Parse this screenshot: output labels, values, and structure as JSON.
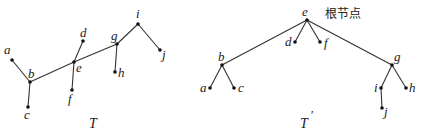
{
  "trees": [
    {
      "name": "T",
      "caption": "T",
      "nodes": [
        {
          "id": "a",
          "label": "a",
          "x": 12,
          "y": 60,
          "lx": 4,
          "ly": 54
        },
        {
          "id": "b",
          "label": "b",
          "x": 30,
          "y": 82,
          "lx": 28,
          "ly": 78
        },
        {
          "id": "c",
          "label": "c",
          "x": 28,
          "y": 107,
          "lx": 24,
          "ly": 119
        },
        {
          "id": "e",
          "label": "e",
          "x": 74,
          "y": 62,
          "lx": 76,
          "ly": 72
        },
        {
          "id": "d",
          "label": "d",
          "x": 83,
          "y": 41,
          "lx": 80,
          "ly": 37
        },
        {
          "id": "f",
          "label": "f",
          "x": 72,
          "y": 90,
          "lx": 68,
          "ly": 103
        },
        {
          "id": "g",
          "label": "g",
          "x": 117,
          "y": 44,
          "lx": 111,
          "ly": 40
        },
        {
          "id": "h",
          "label": "h",
          "x": 115,
          "y": 72,
          "lx": 118,
          "ly": 77
        },
        {
          "id": "i",
          "label": "i",
          "x": 138,
          "y": 24,
          "lx": 136,
          "ly": 18
        },
        {
          "id": "j",
          "label": "j",
          "x": 160,
          "y": 50,
          "lx": 162,
          "ly": 59
        }
      ],
      "edges": [
        [
          "a",
          "b"
        ],
        [
          "b",
          "c"
        ],
        [
          "b",
          "e"
        ],
        [
          "e",
          "d"
        ],
        [
          "e",
          "f"
        ],
        [
          "e",
          "g"
        ],
        [
          "g",
          "h"
        ],
        [
          "g",
          "i"
        ],
        [
          "i",
          "j"
        ]
      ],
      "caption_pos": {
        "x": 89,
        "y": 128
      }
    },
    {
      "name": "T'",
      "caption": "T",
      "caption_prime": "'",
      "root_annotation": "根节点",
      "nodes": [
        {
          "id": "e",
          "label": "e",
          "x": 307,
          "y": 20,
          "lx": 302,
          "ly": 16
        },
        {
          "id": "d",
          "label": "d",
          "x": 295,
          "y": 42,
          "lx": 285,
          "ly": 46
        },
        {
          "id": "f",
          "label": "f",
          "x": 320,
          "y": 42,
          "lx": 324,
          "ly": 47
        },
        {
          "id": "b",
          "label": "b",
          "x": 222,
          "y": 65,
          "lx": 218,
          "ly": 61
        },
        {
          "id": "a",
          "label": "a",
          "x": 210,
          "y": 88,
          "lx": 200,
          "ly": 92
        },
        {
          "id": "c",
          "label": "c",
          "x": 234,
          "y": 88,
          "lx": 238,
          "ly": 92
        },
        {
          "id": "g",
          "label": "g",
          "x": 392,
          "y": 65,
          "lx": 394,
          "ly": 61
        },
        {
          "id": "i",
          "label": "i",
          "x": 381,
          "y": 88,
          "lx": 374,
          "ly": 92
        },
        {
          "id": "h",
          "label": "h",
          "x": 406,
          "y": 88,
          "lx": 409,
          "ly": 92
        },
        {
          "id": "j",
          "label": "j",
          "x": 382,
          "y": 108,
          "lx": 384,
          "ly": 116
        }
      ],
      "edges": [
        [
          "e",
          "b"
        ],
        [
          "e",
          "d"
        ],
        [
          "e",
          "f"
        ],
        [
          "e",
          "g"
        ],
        [
          "b",
          "a"
        ],
        [
          "b",
          "c"
        ],
        [
          "g",
          "i"
        ],
        [
          "g",
          "h"
        ],
        [
          "i",
          "j"
        ]
      ],
      "caption_pos": {
        "x": 300,
        "y": 128
      },
      "annotation_pos": {
        "x": 325,
        "y": 18
      }
    }
  ]
}
